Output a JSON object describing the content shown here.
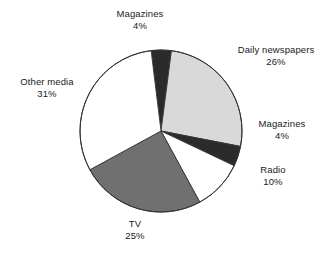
{
  "chart_data": {
    "type": "pie",
    "title": "",
    "subtitle": "",
    "xlabel": "",
    "ylabel": "",
    "legend_position": "none",
    "grid": false,
    "labels_outside": true,
    "value_suffix": "%",
    "categories": [
      "Magazines",
      "Daily newspapers",
      "Magazines",
      "Radio",
      "TV",
      "Other media"
    ],
    "values": [
      4,
      26,
      4,
      10,
      25,
      31
    ],
    "slices": [
      {
        "name": "Magazines",
        "label": "Magazines",
        "value": 4,
        "value_text": "4%",
        "color": "#2b2b2b",
        "start_angle": -7,
        "end_angle": 7.4
      },
      {
        "name": "Daily newspapers",
        "label": "Daily newspapers",
        "value": 26,
        "value_text": "26%",
        "color": "#d9d9d9",
        "start_angle": 7.4,
        "end_angle": 101
      },
      {
        "name": "Magazines",
        "label": "Magazines",
        "value": 4,
        "value_text": "4%",
        "color": "#2b2b2b",
        "start_angle": 101,
        "end_angle": 115.4
      },
      {
        "name": "Radio",
        "label": "Radio",
        "value": 10,
        "value_text": "10%",
        "color": "#ffffff",
        "start_angle": 115.4,
        "end_angle": 151.4
      },
      {
        "name": "TV",
        "label": "TV",
        "value": 25,
        "value_text": "25%",
        "color": "#707070",
        "start_angle": 151.4,
        "end_angle": 241.4
      },
      {
        "name": "Other media",
        "label": "Other media",
        "value": 31,
        "value_text": "31%",
        "color": "#ffffff",
        "start_angle": 241.4,
        "end_angle": 353
      }
    ],
    "geometry": {
      "center_x": 161,
      "center_y": 131,
      "radius": 81,
      "outline_color": "#333333"
    }
  },
  "labels": {
    "magazines_top": {
      "name": "Magazines",
      "value": "4%"
    },
    "daily_newspapers": {
      "name": "Daily newspapers",
      "value": "26%"
    },
    "magazines_right": {
      "name": "Magazines",
      "value": "4%"
    },
    "radio": {
      "name": "Radio",
      "value": "10%"
    },
    "tv": {
      "name": "TV",
      "value": "25%"
    },
    "other_media": {
      "name": "Other media",
      "value": "31%"
    }
  },
  "colors": {
    "background": "#ffffff",
    "text": "#1a1a1a",
    "stroke": "#333333",
    "light_gray": "#d9d9d9",
    "mid_gray": "#707070",
    "dark": "#2b2b2b",
    "white": "#ffffff"
  }
}
